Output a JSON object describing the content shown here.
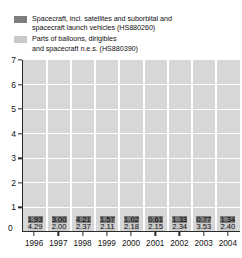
{
  "legend": {
    "entries": [
      {
        "swatch": "dark",
        "color": "#7d7d7d",
        "line1": "Spacecraft, incl. satellites and suborbital and",
        "line2": "spacecraft launch vehicles (HS880260)"
      },
      {
        "swatch": "light",
        "color": "#c9c9c9",
        "line1": "Parts of balloons, dirigibles",
        "line2": "and spacecraft n.e.s. (HS880390)"
      }
    ]
  },
  "axis": {
    "y_ticks": [
      "0",
      "1",
      "2",
      "3",
      "4",
      "5",
      "6",
      "7"
    ],
    "x_ticks": [
      "1996",
      "1997",
      "1998",
      "1999",
      "2000",
      "2001",
      "2002",
      "2003",
      "2004"
    ]
  },
  "chart_data": {
    "type": "bar",
    "stacked": true,
    "title": "",
    "xlabel": "",
    "ylabel": "",
    "ylim": [
      0,
      7
    ],
    "grid": true,
    "legend_position": "top",
    "categories": [
      "1996",
      "1997",
      "1998",
      "1999",
      "2000",
      "2001",
      "2002",
      "2003",
      "2004"
    ],
    "series": [
      {
        "name": "Parts of balloons, dirigibles and spacecraft n.e.s. (HS880390)",
        "color": "#c9c9c9",
        "values": [
          4.29,
          2.0,
          2.37,
          2.11,
          2.18,
          2.15,
          2.34,
          3.53,
          2.4
        ],
        "labels": [
          "4.29",
          "2.00",
          "2.37",
          "2.11",
          "2.18",
          "2.15",
          "2.34",
          "3.53",
          "2.40"
        ]
      },
      {
        "name": "Spacecraft, incl. satellites and suborbital and spacecraft launch vehicles (HS880260)",
        "color": "#7d7d7d",
        "values": [
          1.93,
          3.0,
          4.21,
          1.57,
          1.02,
          0.61,
          1.33,
          0.77,
          1.34
        ],
        "labels": [
          "1.93",
          "3.00",
          "4.21",
          "1.57",
          "1.02",
          "0.61",
          "1.33",
          "0.77",
          "1.34"
        ]
      }
    ],
    "totals": [
      6.22,
      5.0,
      6.58,
      3.68,
      3.2,
      2.76,
      3.67,
      4.3,
      3.74
    ]
  }
}
